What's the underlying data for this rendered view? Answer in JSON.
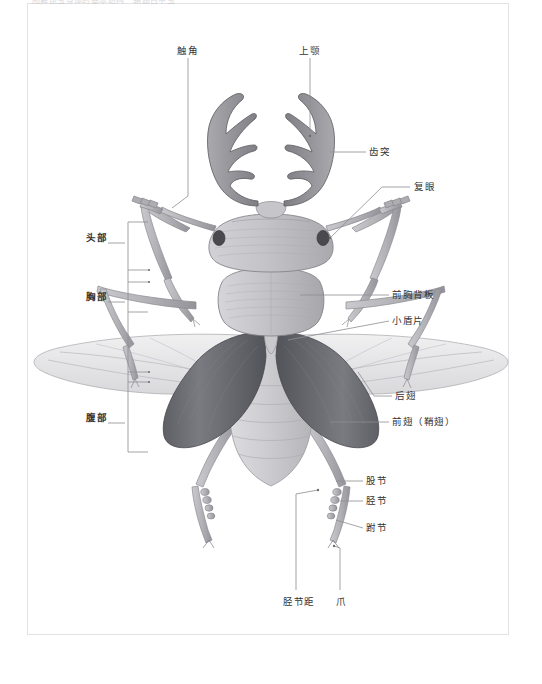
{
  "page": {
    "caption": "图解昆虫身体的基本结构 · 鞘翅目甲虫",
    "background": "#ffffff",
    "frame_color": "#e3e3e6"
  },
  "diagram": {
    "orientation": "dorsal view",
    "colors": {
      "mandible": "#8d8d92",
      "mandible_light": "#b7b7bb",
      "head": "#bdbdc1",
      "pronotum": "#c2c2c6",
      "elytra": "#6f6f75",
      "elytra_light": "#8c8c92",
      "hindwing": "#e4e4e6",
      "abdomen": "#cfcfd2",
      "leg": "#b6b6ba",
      "eye": "#4a4a4e",
      "leader_line": "#8e8e93"
    }
  },
  "labels": {
    "left": [
      {
        "id": "head",
        "text": "头部",
        "bold": true,
        "x": 86,
        "y": 238
      },
      {
        "id": "thorax",
        "text": "胸部",
        "bold": true,
        "x": 86,
        "y": 297
      },
      {
        "id": "abdomen",
        "text": "腹部",
        "bold": true,
        "x": 86,
        "y": 418
      }
    ],
    "top": [
      {
        "id": "antenna",
        "text": "触角",
        "x": 177,
        "y": 45
      },
      {
        "id": "mandible",
        "text": "上颚",
        "x": 299,
        "y": 45
      }
    ],
    "right": [
      {
        "id": "tooth-process",
        "text": "齿突",
        "x": 369,
        "y": 148
      },
      {
        "id": "compound-eye",
        "text": "复眼",
        "x": 414,
        "y": 183
      },
      {
        "id": "pronotum",
        "text": "前胸背板",
        "x": 392,
        "y": 291
      },
      {
        "id": "scutellum",
        "text": "小盾片",
        "x": 392,
        "y": 317
      },
      {
        "id": "hindwing",
        "text": "后翅",
        "x": 395,
        "y": 392
      },
      {
        "id": "forewing",
        "text": "前翅（鞘翅）",
        "x": 392,
        "y": 418
      },
      {
        "id": "femur",
        "text": "股节",
        "x": 366,
        "y": 477
      },
      {
        "id": "tibia",
        "text": "胫节",
        "x": 366,
        "y": 497
      },
      {
        "id": "tarsus",
        "text": "跗节",
        "x": 366,
        "y": 524
      }
    ],
    "bottom": [
      {
        "id": "tibial-spur",
        "text": "胫节距",
        "x": 283,
        "y": 598
      },
      {
        "id": "claw",
        "text": "爪",
        "x": 336,
        "y": 598
      }
    ]
  }
}
